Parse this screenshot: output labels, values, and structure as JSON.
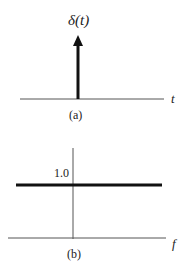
{
  "panel_a": {
    "function_label": "δ(t)",
    "axis_label": "t",
    "caption": "(a)"
  },
  "panel_b": {
    "level_label": "1.0",
    "axis_label": "f",
    "caption": "(b)"
  },
  "colors": {
    "ink": "#222222",
    "axis": "#555555",
    "background": "#ffffff"
  }
}
